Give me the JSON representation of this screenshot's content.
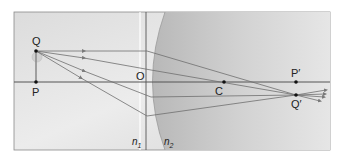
{
  "diagram": {
    "colors": {
      "background": "#e4e4e4",
      "medium2": "#c4c4c4",
      "axis": "#555555",
      "ray": "#6e6e6e",
      "point": "#111111"
    },
    "labels": {
      "object_top": "Q",
      "object_base": "P",
      "vertex": "O",
      "center": "C",
      "image_axis": "P′",
      "image_point": "Q′",
      "n1": "n",
      "n1_sub": "1",
      "n2": "n",
      "n2_sub": "2"
    },
    "points": {
      "Q": [
        36,
        51
      ],
      "P": [
        36,
        82
      ],
      "O": [
        146,
        82
      ],
      "C": [
        224,
        82
      ],
      "P_prime": [
        296,
        82
      ],
      "Q_prime": [
        296,
        95
      ]
    },
    "rays": [
      {
        "from": [
          36,
          51
        ],
        "surface": [
          147,
          51
        ],
        "to": [
          296,
          95
        ]
      },
      {
        "from": [
          36,
          51
        ],
        "surface": [
          151,
          70
        ],
        "to": [
          296,
          95
        ]
      },
      {
        "from": [
          36,
          51
        ],
        "surface": [
          151,
          97
        ],
        "to": [
          296,
          95
        ]
      },
      {
        "from": [
          36,
          51
        ],
        "surface": [
          147,
          116
        ],
        "to": [
          296,
          95
        ]
      }
    ]
  }
}
